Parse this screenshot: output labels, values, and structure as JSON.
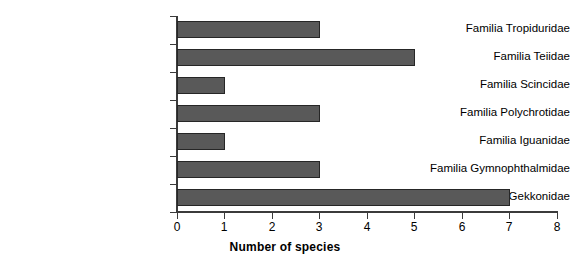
{
  "chart_data": {
    "type": "bar",
    "orientation": "horizontal",
    "title": "",
    "subtitle": "",
    "xlabel": "Number of species",
    "ylabel": "",
    "categories": [
      "Familia Tropiduridae",
      "Familia Teiidae",
      "Familia Scincidae",
      "Familia Polychrotidae",
      "Familia Iguanidae",
      "Familia Gymnophthalmidae",
      "Familia Gekkonidae"
    ],
    "values": [
      3,
      5,
      1,
      3,
      1,
      3,
      7
    ],
    "xlim": [
      0,
      8
    ],
    "xticks": [
      0,
      1,
      2,
      3,
      4,
      5,
      6,
      7,
      8
    ],
    "xtick_labels": [
      "0",
      "1",
      "2",
      "3",
      "4",
      "5",
      "6",
      "7",
      "8"
    ],
    "grid": false,
    "legend": false,
    "legend_position": "none",
    "bar_color": "#595959",
    "bar_edge_color": "#262626",
    "axis_color": "#3b3b3b",
    "background_color": "#ffffff"
  }
}
